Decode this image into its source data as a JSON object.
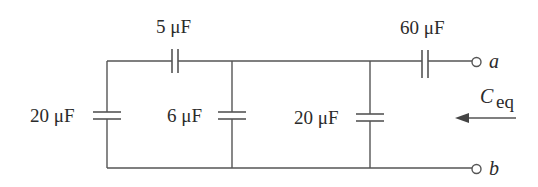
{
  "diagram": {
    "type": "capacitor-circuit",
    "components": [
      {
        "id": "C1",
        "label": "20 μF",
        "value_uF": 20,
        "orientation": "vertical",
        "position": "left shunt"
      },
      {
        "id": "C2",
        "label": "5 μF",
        "value_uF": 5,
        "orientation": "horizontal",
        "position": "top series"
      },
      {
        "id": "C3",
        "label": "6 μF",
        "value_uF": 6,
        "orientation": "vertical",
        "position": "middle shunt"
      },
      {
        "id": "C4",
        "label": "20 μF",
        "value_uF": 20,
        "orientation": "vertical",
        "position": "right shunt"
      },
      {
        "id": "C5",
        "label": "60 μF",
        "value_uF": 60,
        "orientation": "horizontal",
        "position": "output series"
      }
    ],
    "terminals": [
      {
        "id": "a",
        "label": "a"
      },
      {
        "id": "b",
        "label": "b"
      }
    ],
    "equivalent": {
      "symbol": "C",
      "subscript": "eq",
      "arrow_direction": "left"
    }
  }
}
